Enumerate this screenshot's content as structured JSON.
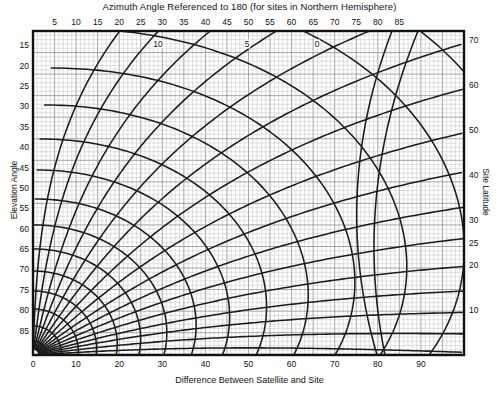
{
  "chart_data": {
    "type": "line",
    "title": "Azimuth Angle Referenced to 180 (for sites in Northern Hemisphere)",
    "subtitle": "",
    "xlabel": "Difference Between Satellite and Site",
    "ylabel": "Elevation Angle",
    "y2label": "Site Latitude",
    "x2label": "Azimuth Angle Referenced to 180 (for sites in Northern Hemisphere)",
    "xlim": [
      0,
      100
    ],
    "x2lim": [
      0,
      100
    ],
    "ylim_left_top": 10,
    "ylim_left_bottom": 90,
    "y2lim": [
      0,
      72
    ],
    "grid": true,
    "legend": "none",
    "x_ticks": [
      0,
      10,
      20,
      30,
      40,
      50,
      60,
      70,
      80,
      90
    ],
    "x_tick_labels": [
      "0",
      "10",
      "20",
      "30",
      "40",
      "50",
      "60",
      "70",
      "80",
      "90"
    ],
    "x2_ticks": [
      5,
      10,
      15,
      20,
      25,
      30,
      35,
      40,
      45,
      50,
      55,
      60,
      65,
      70,
      75,
      80,
      85
    ],
    "x2_tick_labels": [
      "5",
      "10",
      "15",
      "20",
      "25",
      "30",
      "35",
      "40",
      "45",
      "50",
      "55",
      "60",
      "65",
      "70",
      "75",
      "80",
      "85"
    ],
    "y_left_ticks": [
      15,
      20,
      25,
      30,
      35,
      40,
      45,
      50,
      55,
      60,
      65,
      70,
      75,
      80,
      85
    ],
    "y_left_tick_labels": [
      "15",
      "20",
      "25",
      "30",
      "35",
      "40",
      "45",
      "50",
      "55",
      "60",
      "65",
      "70",
      "75",
      "80",
      "85"
    ],
    "y_right_ticks": [
      70,
      60,
      50,
      40,
      30,
      25,
      20,
      10
    ],
    "y_right_tick_labels": [
      "70",
      "60",
      "50",
      "40",
      "30",
      "25",
      "20",
      "10"
    ],
    "annotations": [
      {
        "text": "10",
        "x_px": 158,
        "y_px": 44
      },
      {
        "text": "5",
        "x_px": 247,
        "y_px": 44
      },
      {
        "text": "0",
        "x_px": 317,
        "y_px": 44
      }
    ],
    "series": [
      {
        "name": "elevation-angle-family",
        "curve_count": 16
      },
      {
        "name": "azimuth-angle-family",
        "curve_count": 15
      }
    ]
  },
  "plot_geometry": {
    "left_px": 33,
    "right_px": 464,
    "top_px": 31,
    "bottom_px": 355,
    "fine_grid_px": 4.31,
    "major_grid_px": 21.55
  },
  "colors": {
    "background": "#ffffff",
    "frame": "#111111",
    "curve": "#1c1c1c",
    "grid_fine": "#bcbcbc",
    "grid_major": "#8a8a8a",
    "text": "#111111"
  }
}
